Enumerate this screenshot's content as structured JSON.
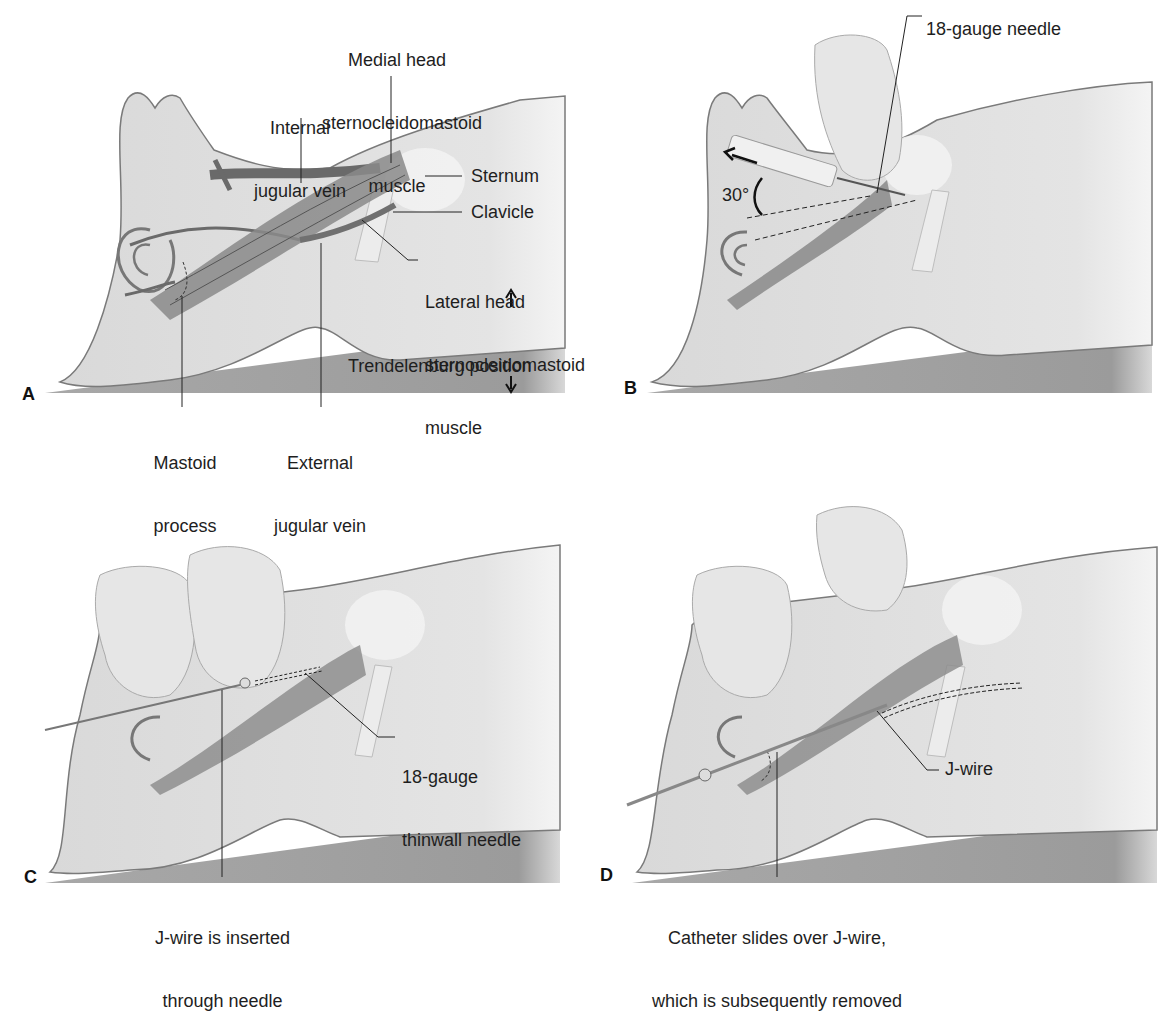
{
  "figure": {
    "panels": [
      {
        "letter": "A",
        "labels": {
          "medial_head_1": "Medial head",
          "medial_head_2": "sternocleidomastoid",
          "medial_head_3": "muscle",
          "internal_jugular_1": "Internal",
          "internal_jugular_2": "jugular vein",
          "sternum": "Sternum",
          "clavicle": "Clavicle",
          "lateral_head_1": "Lateral head",
          "lateral_head_2": "sternocleidomastoid",
          "lateral_head_3": "muscle",
          "trendelenburg": "Trendelenburg position",
          "mastoid_1": "Mastoid",
          "mastoid_2": "process",
          "external_jugular_1": "External",
          "external_jugular_2": "jugular vein"
        }
      },
      {
        "letter": "B",
        "labels": {
          "needle": "18-gauge needle",
          "angle": "30°"
        }
      },
      {
        "letter": "C",
        "labels": {
          "thinwall_1": "18-gauge",
          "thinwall_2": "thinwall needle",
          "jwire_inserted_1": "J-wire is inserted",
          "jwire_inserted_2": "through needle"
        }
      },
      {
        "letter": "D",
        "labels": {
          "jwire": "J-wire",
          "catheter_1": "Catheter slides over J-wire,",
          "catheter_2": "which is subsequently removed"
        }
      }
    ]
  }
}
